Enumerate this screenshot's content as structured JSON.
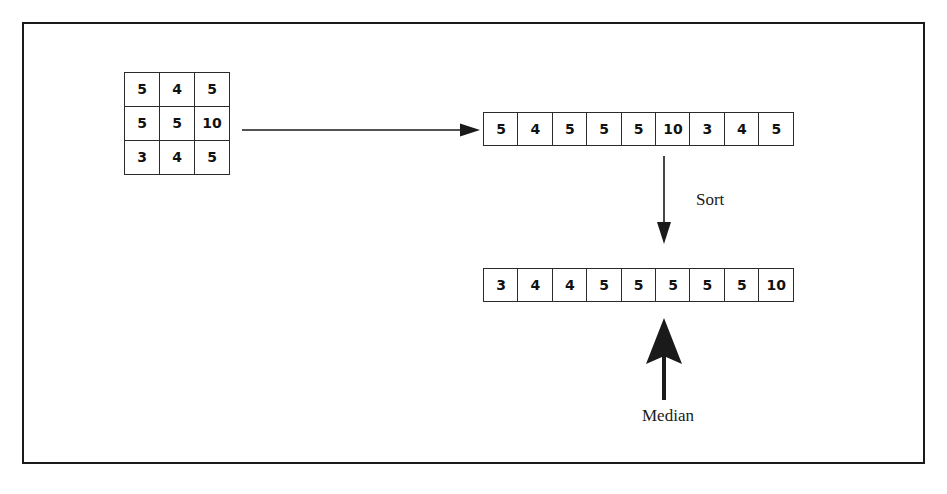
{
  "figure": {
    "type": "median-filter-illustration",
    "border_color": "#1a1a1a",
    "background": "#ffffff",
    "ink_color": "#111111"
  },
  "matrix": {
    "name": "3x3 neighborhood window",
    "rows": [
      [
        "5",
        "4",
        "5"
      ],
      [
        "5",
        "5",
        "10"
      ],
      [
        "3",
        "4",
        "5"
      ]
    ]
  },
  "arrays": {
    "unsorted": {
      "label": "unsorted values",
      "values": [
        "5",
        "4",
        "5",
        "5",
        "5",
        "10",
        "3",
        "4",
        "5"
      ]
    },
    "sorted": {
      "label": "sorted values",
      "values": [
        "3",
        "4",
        "4",
        "5",
        "5",
        "5",
        "5",
        "5",
        "10"
      ],
      "median_index": 4,
      "median_value": "5"
    }
  },
  "labels": {
    "sort": "Sort",
    "median": "Median"
  },
  "icons": {
    "transfer_arrow": "arrow-right-icon",
    "sort_arrow": "arrow-down-icon",
    "median_arrow": "arrow-up-thick-icon"
  }
}
